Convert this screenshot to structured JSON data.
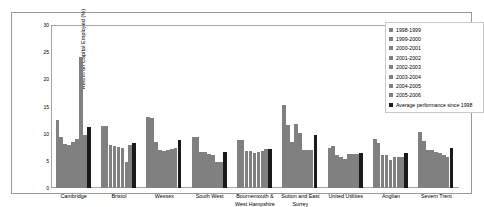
{
  "chart_data": {
    "type": "bar",
    "title": "",
    "xlabel": "",
    "ylabel": "Return on Capital Employed (%)",
    "ylim": [
      0,
      30
    ],
    "yticks": [
      0,
      5,
      10,
      15,
      20,
      25,
      30
    ],
    "grid": false,
    "legend_position": "top-right",
    "categories": [
      "Cambridge",
      "Bristol",
      "Wessex",
      "South West",
      "Bournemouth &\nWest Hampshire",
      "Sutton and East\nSurrey",
      "United Utilities",
      "Anglian",
      "Severn Trent"
    ],
    "series": [
      {
        "name": "1998-1999",
        "color": "#808080",
        "values": [
          12.6,
          11.4,
          13.1,
          9.3,
          8.8,
          15.3,
          7.4,
          9.0,
          10.4
        ]
      },
      {
        "name": "1999-2000",
        "color": "#808080",
        "values": [
          9.4,
          11.4,
          12.8,
          9.3,
          8.8,
          11.6,
          7.8,
          8.2,
          8.7
        ]
      },
      {
        "name": "2000-2001",
        "color": "#808080",
        "values": [
          8.1,
          7.9,
          8.4,
          6.6,
          6.9,
          8.4,
          6.1,
          6.0,
          7.0
        ]
      },
      {
        "name": "2001-2002",
        "color": "#808080",
        "values": [
          8.0,
          7.7,
          7.0,
          6.6,
          6.8,
          11.8,
          5.7,
          6.1,
          7.0
        ]
      },
      {
        "name": "2002-2003",
        "color": "#808080",
        "values": [
          8.4,
          7.5,
          6.9,
          6.3,
          6.4,
          10.2,
          5.4,
          5.1,
          6.7
        ]
      },
      {
        "name": "2003-2004",
        "color": "#808080",
        "values": [
          9.1,
          7.3,
          7.0,
          6.1,
          6.6,
          7.0,
          6.2,
          5.7,
          6.5
        ]
      },
      {
        "name": "2004-2005",
        "color": "#808080",
        "values": [
          24.1,
          4.8,
          7.2,
          4.8,
          6.9,
          7.0,
          6.3,
          5.8,
          6.1
        ]
      },
      {
        "name": "2005-2006",
        "color": "#808080",
        "values": [
          9.8,
          7.9,
          7.3,
          4.7,
          7.1,
          7.0,
          6.3,
          5.8,
          5.8
        ]
      },
      {
        "name": "Average performance since 1998",
        "color": "#1a1a1a",
        "values": [
          11.3,
          8.2,
          8.8,
          6.7,
          7.1,
          9.8,
          6.5,
          6.4,
          7.3
        ]
      }
    ],
    "extra_bar_after_average": {
      "name": "1998-1999-next",
      "note": ""
    }
  },
  "legend": {
    "items": [
      {
        "label": "1998-1999",
        "color": "#808080"
      },
      {
        "label": "1999-2000",
        "color": "#808080"
      },
      {
        "label": "2000-2001",
        "color": "#808080"
      },
      {
        "label": "2001-2002",
        "color": "#808080"
      },
      {
        "label": "2002-2003",
        "color": "#808080"
      },
      {
        "label": "2003-2004",
        "color": "#808080"
      },
      {
        "label": "2004-2005",
        "color": "#808080"
      },
      {
        "label": "2005-2006",
        "color": "#808080"
      },
      {
        "label": "Average performance since 1998",
        "color": "#1a1a1a"
      }
    ]
  },
  "colors": {
    "bar_gray": "#808080",
    "bar_black": "#1a1a1a",
    "axis": "#7f7f7f",
    "frame": "#9a9a9a"
  }
}
